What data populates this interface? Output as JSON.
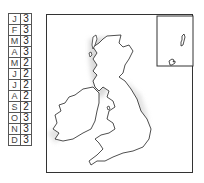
{
  "legend_table": {
    "rows": [
      {
        "month": "J",
        "value": "3"
      },
      {
        "month": "F",
        "value": "3"
      },
      {
        "month": "M",
        "value": "3"
      },
      {
        "month": "A",
        "value": "3"
      },
      {
        "month": "M",
        "value": "2"
      },
      {
        "month": "J",
        "value": "2"
      },
      {
        "month": "J",
        "value": "2"
      },
      {
        "month": "A",
        "value": "2"
      },
      {
        "month": "S",
        "value": "2"
      },
      {
        "month": "O",
        "value": "3"
      },
      {
        "month": "N",
        "value": "3"
      },
      {
        "month": "D",
        "value": "3"
      }
    ]
  },
  "map": {
    "region": "British Isles",
    "inset": "Shetland / Orkney",
    "colors": {
      "outline": "#333333",
      "highlight": "#d9d9d9",
      "land": "#ffffff"
    }
  }
}
